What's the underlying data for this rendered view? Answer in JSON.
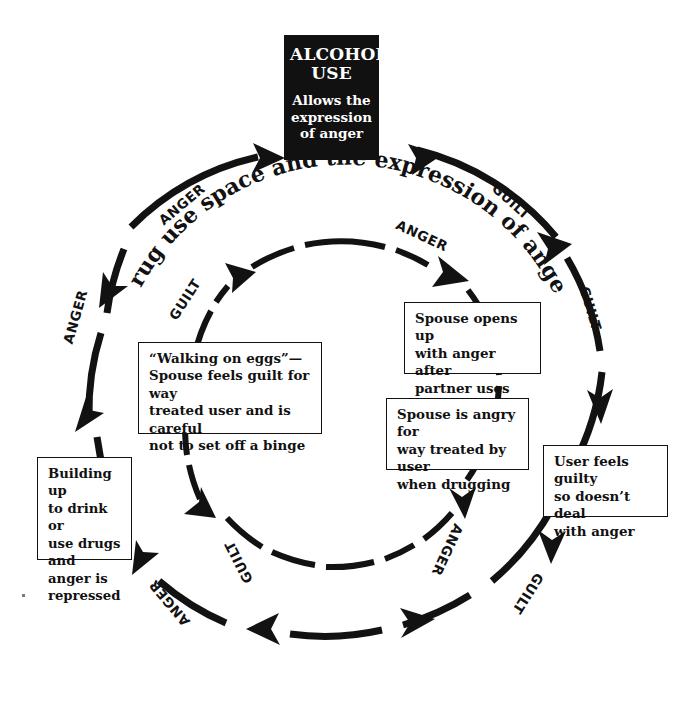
{
  "diagram": {
    "title": "Drug use space and the expression of anger",
    "center_caption": "Drug use space and the expression of anger",
    "focus_box": {
      "title_line_1": "ALCOHOL",
      "title_line_2": "USE",
      "subtitle": "Allows the\nexpression\nof anger"
    },
    "notes": [
      {
        "id": "spouse-opens-up",
        "text": "Spouse opens up\nwith anger after\npartner uses drugs"
      },
      {
        "id": "spouse-is-angry",
        "text": "Spouse is angry for\nway treated by user\nwhen drugging"
      },
      {
        "id": "user-feels-guilty",
        "text": "User feels guilty\nso doesn’t deal\nwith anger"
      },
      {
        "id": "walking-on-eggs",
        "text": "“Walking on eggs”—\nSpouse feels guilt for way\ntreated user and is careful\nnot to set off a binge"
      },
      {
        "id": "building-up",
        "text": "Building up\nto drink or\nuse drugs\nand anger is\nrepressed"
      }
    ],
    "outer_ring_labels": [
      {
        "id": "outer-anger-upper-left",
        "text": "ANGER"
      },
      {
        "id": "outer-guilt-upper-right",
        "text": "GUILT"
      },
      {
        "id": "outer-guilt-right",
        "text": "GUILT"
      },
      {
        "id": "outer-anger-left",
        "text": "ANGER"
      },
      {
        "id": "outer-guilt-lower-right",
        "text": "GUILT"
      },
      {
        "id": "outer-anger-lower-left",
        "text": "ANGER"
      }
    ],
    "inner_ring_labels": [
      {
        "id": "inner-anger-upper-right",
        "text": "ANGER"
      },
      {
        "id": "inner-guilt-upper-left",
        "text": "GUILT"
      },
      {
        "id": "inner-anger-lower-right",
        "text": "ANGER"
      },
      {
        "id": "inner-guilt-lower-left",
        "text": "GUILT"
      }
    ],
    "colors": {
      "ink": "#121212",
      "focus_box_background": "#111111",
      "focus_box_text": "#ffffff",
      "page_background": "#ffffff"
    }
  }
}
